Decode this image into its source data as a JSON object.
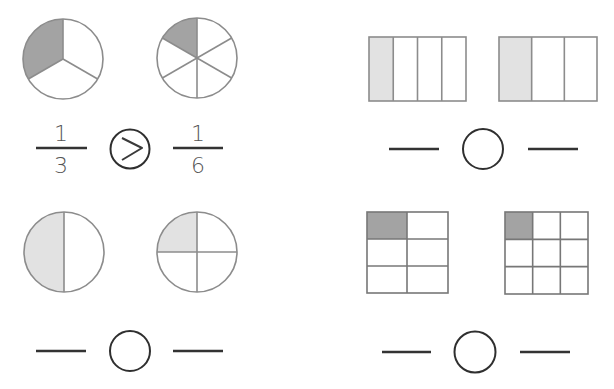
{
  "worksheet": {
    "topic": "Comparing unit fractions",
    "colors": {
      "shade_dark": "#a3a3a3",
      "shade_light": "#e2e2e2",
      "outline": "#8c8c8c",
      "answer_ink": "#333333",
      "text": "#555555"
    },
    "problems": [
      {
        "id": "p1",
        "position": "top-left",
        "shape": "circle",
        "left_model": {
          "parts": 3,
          "shaded": 1,
          "fraction": "1/3"
        },
        "right_model": {
          "parts": 6,
          "shaded": 1,
          "fraction": "1/6"
        },
        "answer": {
          "left_numerator": "1",
          "left_denominator": "3",
          "comparison": ">",
          "right_numerator": "1",
          "right_denominator": "6",
          "filled": true
        }
      },
      {
        "id": "p2",
        "position": "top-right",
        "shape": "rectangle-strip",
        "left_model": {
          "parts": 4,
          "shaded": 1,
          "fraction": "1/4"
        },
        "right_model": {
          "parts": 3,
          "shaded": 1,
          "fraction": "1/3"
        },
        "answer": {
          "left": "",
          "comparison": "",
          "right": "",
          "filled": false
        }
      },
      {
        "id": "p3",
        "position": "bottom-left",
        "shape": "circle",
        "left_model": {
          "parts": 2,
          "shaded": 1,
          "fraction": "1/2"
        },
        "right_model": {
          "parts": 4,
          "shaded": 1,
          "fraction": "1/4"
        },
        "answer": {
          "left": "",
          "comparison": "",
          "right": "",
          "filled": false
        }
      },
      {
        "id": "p4",
        "position": "bottom-right",
        "shape": "grid",
        "left_model": {
          "parts": 6,
          "rows": 3,
          "cols": 2,
          "shaded": 1,
          "fraction": "1/6"
        },
        "right_model": {
          "parts": 9,
          "rows": 3,
          "cols": 3,
          "shaded": 1,
          "fraction": "1/9"
        },
        "answer": {
          "left": "",
          "comparison": "",
          "right": "",
          "filled": false
        }
      }
    ]
  }
}
